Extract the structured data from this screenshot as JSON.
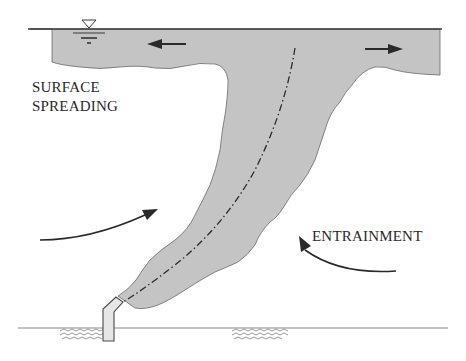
{
  "diagram": {
    "labels": {
      "surface_spreading_line1": "SURFACE",
      "surface_spreading_line2": "SPREADING",
      "entrainment": "ENTRAINMENT"
    },
    "symbols": {
      "water_surface": "inverted-triangle-water-level",
      "centerline": "dash-dot trajectory",
      "arrows": [
        "spreading-left",
        "spreading-right",
        "entrainment-left",
        "entrainment-right"
      ]
    },
    "colors": {
      "plume_fill": "#c4c4c4",
      "outline": "#3a3a3a",
      "text": "#2a2a2a",
      "background": "#ffffff"
    }
  }
}
